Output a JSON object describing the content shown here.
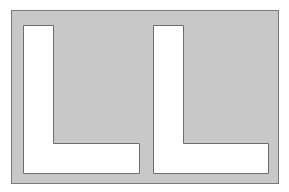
{
  "diagram": {
    "colors": {
      "background": "#ffffff",
      "panel": "#c8c8c8",
      "panel_border": "#7a7a7a",
      "letter_fill": "#ffffff",
      "letter_stroke": "#6e6e6e"
    },
    "letters": [
      {
        "glyph": "L",
        "position": "left"
      },
      {
        "glyph": "L",
        "position": "right"
      }
    ]
  }
}
